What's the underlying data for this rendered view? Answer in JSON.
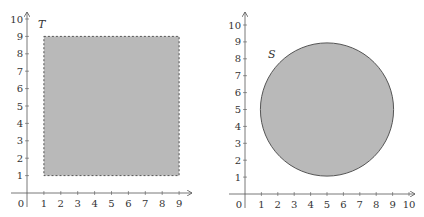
{
  "colors": {
    "axis": "#555555",
    "fill": "#b9b9b9",
    "stroke": "#555555",
    "text": "#333333"
  },
  "chart_data": [
    {
      "type": "diagram",
      "title": "",
      "shape": "square",
      "label": "T",
      "border": "dashed",
      "x_ticks": [
        "0",
        "1",
        "2",
        "3",
        "4",
        "5",
        "6",
        "7",
        "8",
        "9"
      ],
      "y_ticks": [
        "1",
        "2",
        "3",
        "4",
        "5",
        "6",
        "7",
        "8",
        "9",
        "10"
      ],
      "xlim": [
        0,
        9
      ],
      "ylim": [
        0,
        10
      ],
      "rect": {
        "x1": 1,
        "y1": 1,
        "x2": 9,
        "y2": 9
      }
    },
    {
      "type": "diagram",
      "title": "",
      "shape": "circle",
      "label": "S",
      "border": "solid",
      "x_ticks": [
        "0",
        "1",
        "2",
        "3",
        "4",
        "5",
        "6",
        "7",
        "8",
        "9",
        "10"
      ],
      "y_ticks": [
        "1",
        "2",
        "3",
        "4",
        "5",
        "6",
        "7",
        "8",
        "9",
        "10"
      ],
      "xlim": [
        0,
        10
      ],
      "ylim": [
        0,
        10
      ],
      "circle": {
        "cx": 5,
        "cy": 5,
        "r": 4
      }
    }
  ]
}
